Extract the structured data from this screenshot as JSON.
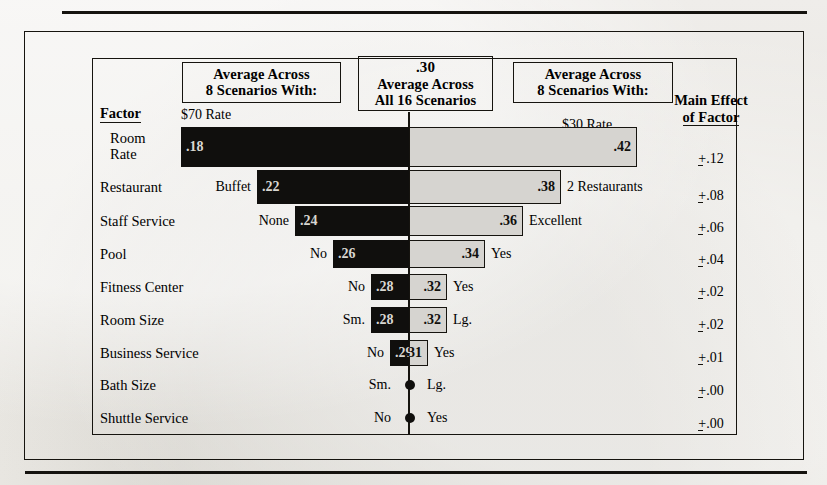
{
  "figure": {
    "headers": {
      "left_box_line1": "Average Across",
      "left_box_line2": "8 Scenarios With:",
      "mid_box_value": ".30",
      "mid_box_line1": "Average Across",
      "mid_box_line2": "All 16 Scenarios",
      "right_box_line1": "Average Across",
      "right_box_line2": "8 Scenarios With:",
      "main_effect_line1": "Main Effect",
      "main_effect_line2": "of Factor",
      "factor_label": "Factor",
      "left_rate_label": "$70 Rate",
      "right_rate_label": "$30 Rate"
    }
  },
  "chart_data": {
    "type": "bar",
    "xlabel": "",
    "ylabel": "Factor",
    "baseline": 0.3,
    "baseline_label": ".30",
    "grid": false,
    "legend": "none",
    "axis_center_value": 0.3,
    "categories": [
      "Room Rate",
      "Restaurant",
      "Staff Service",
      "Pool",
      "Fitness Center",
      "Room Size",
      "Business Service",
      "Bath Size",
      "Shuttle Service"
    ],
    "rows": [
      {
        "factor": "Room\nRate",
        "factor_line1": "Room",
        "factor_line2": "Rate",
        "low_label": "",
        "low_value": 0.18,
        "low_value_text": ".18",
        "high_label": "",
        "high_value": 0.42,
        "high_value_text": ".42",
        "main_effect": "+.12",
        "main_effect_number": ".12"
      },
      {
        "factor": "Restaurant",
        "factor_line1": "Restaurant",
        "factor_line2": "",
        "low_label": "Buffet",
        "low_value": 0.22,
        "low_value_text": ".22",
        "high_label": "2 Restaurants",
        "high_value": 0.38,
        "high_value_text": ".38",
        "main_effect": "+.08",
        "main_effect_number": ".08"
      },
      {
        "factor": "Staff Service",
        "factor_line1": "Staff Service",
        "factor_line2": "",
        "low_label": "None",
        "low_value": 0.24,
        "low_value_text": ".24",
        "high_label": "Excellent",
        "high_value": 0.36,
        "high_value_text": ".36",
        "main_effect": "+.06",
        "main_effect_number": ".06"
      },
      {
        "factor": "Pool",
        "factor_line1": "Pool",
        "factor_line2": "",
        "low_label": "No",
        "low_value": 0.26,
        "low_value_text": ".26",
        "high_label": "Yes",
        "high_value": 0.34,
        "high_value_text": ".34",
        "main_effect": "+.04",
        "main_effect_number": ".04"
      },
      {
        "factor": "Fitness Center",
        "factor_line1": "Fitness Center",
        "factor_line2": "",
        "low_label": "No",
        "low_value": 0.28,
        "low_value_text": ".28",
        "high_label": "Yes",
        "high_value": 0.32,
        "high_value_text": ".32",
        "main_effect": "+.02",
        "main_effect_number": ".02"
      },
      {
        "factor": "Room Size",
        "factor_line1": "Room Size",
        "factor_line2": "",
        "low_label": "Sm.",
        "low_value": 0.28,
        "low_value_text": ".28",
        "high_label": "Lg.",
        "high_value": 0.32,
        "high_value_text": ".32",
        "main_effect": "+.02",
        "main_effect_number": ".02"
      },
      {
        "factor": "Business Service",
        "factor_line1": "Business Service",
        "factor_line2": "",
        "low_label": "No",
        "low_value": 0.29,
        "low_value_text": ".29",
        "high_label": "Yes",
        "high_value": 0.31,
        "high_value_text": ".31",
        "main_effect": "+.01",
        "main_effect_number": ".01"
      },
      {
        "factor": "Bath Size",
        "factor_line1": "Bath Size",
        "factor_line2": "",
        "low_label": "Sm.",
        "low_value": 0.3,
        "low_value_text": "",
        "high_label": "Lg.",
        "high_value": 0.3,
        "high_value_text": "",
        "main_effect": "+.00",
        "main_effect_number": ".00"
      },
      {
        "factor": "Shuttle Service",
        "factor_line1": "Shuttle Service",
        "factor_line2": "",
        "low_label": "No",
        "low_value": 0.3,
        "low_value_text": "",
        "high_label": "Yes",
        "high_value": 0.3,
        "high_value_text": "",
        "main_effect": "+.00",
        "main_effect_number": ".00"
      }
    ],
    "colors": {
      "negative_bar": "#100f0d",
      "positive_bar": "#d6d4d0",
      "border": "#16140f",
      "paper": "#ebe9e5"
    }
  }
}
